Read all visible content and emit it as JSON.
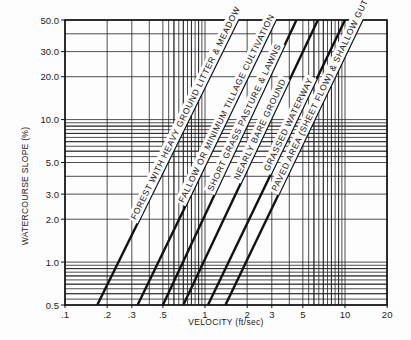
{
  "chart_data": {
    "type": "line",
    "title": "",
    "xlabel": "VELOCITY (ft/sec)",
    "ylabel": "WATERCOURSE SLOPE (%)",
    "xscale": "log",
    "yscale": "log",
    "xlim": [
      0.1,
      20
    ],
    "ylim": [
      0.5,
      50
    ],
    "grid": true,
    "x_ticks": [
      {
        "value": 0.1,
        "label": ".1"
      },
      {
        "value": 0.2,
        "label": ".2"
      },
      {
        "value": 0.3,
        "label": ".3"
      },
      {
        "value": 0.5,
        "label": ".5"
      },
      {
        "value": 1,
        "label": "1"
      },
      {
        "value": 2,
        "label": "2"
      },
      {
        "value": 3,
        "label": "3"
      },
      {
        "value": 5,
        "label": "5"
      },
      {
        "value": 10,
        "label": "10"
      },
      {
        "value": 20,
        "label": "20"
      }
    ],
    "y_ticks": [
      {
        "value": 0.5,
        "label": "0.5"
      },
      {
        "value": 1,
        "label": "1.0"
      },
      {
        "value": 2,
        "label": "2.0"
      },
      {
        "value": 3,
        "label": "3.0"
      },
      {
        "value": 5,
        "label": "5.0"
      },
      {
        "value": 10,
        "label": "10.0"
      },
      {
        "value": 20,
        "label": "20.0"
      },
      {
        "value": 30,
        "label": "30.0"
      },
      {
        "value": 50,
        "label": "50.0"
      }
    ],
    "series": [
      {
        "name": "FOREST WITH HEAVY GROUND LITTER & MEADOW",
        "x": [
          0.17,
          1.72
        ],
        "y": [
          0.5,
          50
        ]
      },
      {
        "name": "FALLOW OR MINIMUM TILLAGE CULTIVATION",
        "x": [
          0.33,
          3.2
        ],
        "y": [
          0.5,
          50
        ]
      },
      {
        "name": "SHORT GRASS PASTURE & LAWNS",
        "x": [
          0.5,
          4.5
        ],
        "y": [
          0.5,
          50
        ]
      },
      {
        "name": "NEARLY BARE GROUND",
        "x": [
          0.7,
          6.4
        ],
        "y": [
          0.5,
          50
        ]
      },
      {
        "name": "GRASSED WATERWAY",
        "x": [
          1.05,
          10.0
        ],
        "y": [
          0.5,
          50
        ]
      },
      {
        "name": "PAVED AREA (SHEET FLOW) & SHALLOW GUTTER FLOW",
        "x": [
          1.4,
          13.3
        ],
        "y": [
          0.5,
          50
        ]
      }
    ]
  },
  "layout": {
    "plot_left": 65,
    "plot_right": 387,
    "plot_top": 20,
    "plot_bottom": 305,
    "px_per_decade_x": 140,
    "px_per_decade_y": 142.5,
    "label_positions": [
      0.28,
      0.34,
      0.38,
      0.42,
      0.45,
      0.38
    ]
  },
  "colors": {
    "ink": "#111111",
    "grid": "#222222",
    "paper": "#fdfdfd"
  }
}
